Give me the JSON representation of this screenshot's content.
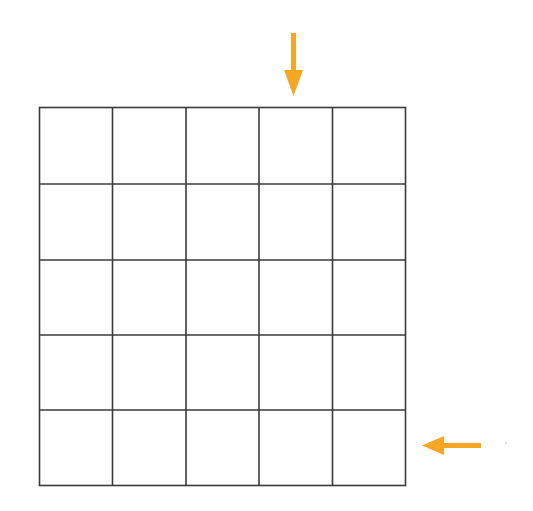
{
  "diagram": {
    "type": "grid",
    "rows": 5,
    "columns": 5,
    "grid_color": "#3a3a3a",
    "arrow_color": "#f5a623",
    "arrows": [
      {
        "name": "down-arrow",
        "direction": "down",
        "points_to": "column 4",
        "position": "above grid"
      },
      {
        "name": "left-arrow",
        "direction": "left",
        "points_to": "row 5",
        "position": "right of grid"
      }
    ]
  }
}
